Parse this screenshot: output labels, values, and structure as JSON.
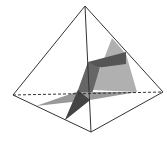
{
  "diagram": {
    "type": "pyramid-with-intersecting-planes",
    "colors": {
      "edge": "#333333",
      "light_plane": "#aaaaaa",
      "dark_plane": "#555555",
      "mid_plane": "#888888"
    }
  }
}
